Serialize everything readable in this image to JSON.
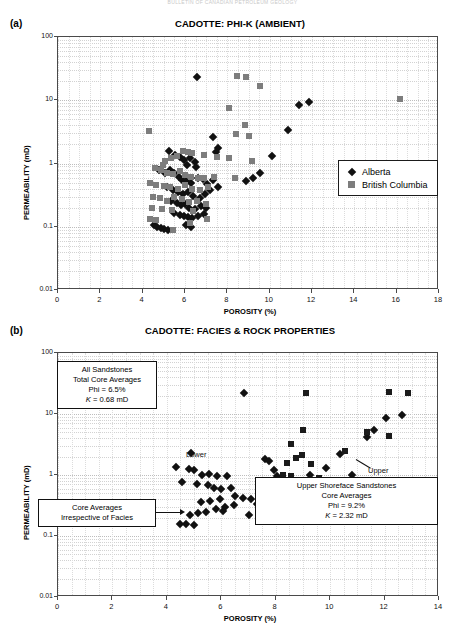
{
  "running_head": "BULLETIN OF CANADIAN PETROLEUM GEOLOGY",
  "panels": [
    {
      "letter": "(a)",
      "title": "CADOTTE: PHI-K (AMBIENT)",
      "legend": [
        {
          "label": "Alberta",
          "marker": "diamond",
          "color": "#111111"
        },
        {
          "label": "British Columbia",
          "marker": "square",
          "color": "#7d7d7d"
        }
      ]
    },
    {
      "letter": "(b)",
      "title": "CADOTTE: FACIES & ROCK PROPERTIES",
      "annotations": [
        {
          "name": "all-sandstones-box",
          "lines": [
            "All Sandstones",
            "Total Core Averages",
            "Phi = 6.5%",
            "K = 0.68 mD"
          ],
          "italic_symbol": "K"
        },
        {
          "name": "core-averages-box",
          "lines": [
            "Core  Averages",
            "Irrespective of Facies"
          ]
        },
        {
          "name": "upper-shoreface-box",
          "lines": [
            "Upper Shoreface Sandstones",
            "Core Averages",
            "Phi = 9.2%",
            "K = 2.32 mD"
          ],
          "italic_symbol": "K"
        }
      ],
      "point_labels": [
        {
          "name": "lower-label",
          "text": "Lower"
        },
        {
          "name": "upper-label",
          "text": "Upper"
        }
      ]
    }
  ],
  "chart_data": [
    {
      "type": "scatter",
      "title": "CADOTTE: PHI-K (AMBIENT)",
      "xlabel": "POROSITY (%)",
      "ylabel": "PERMEABILITY  (mD)",
      "xlim": [
        0,
        18
      ],
      "xticks": [
        0,
        2,
        4,
        6,
        8,
        10,
        12,
        14,
        16,
        18
      ],
      "ylim": [
        0.01,
        100
      ],
      "yscale": "log",
      "yticks": [
        0.01,
        0.1,
        1,
        10,
        100
      ],
      "ytick_labels": [
        "0.01",
        "0.1",
        "1",
        "10",
        "100"
      ],
      "grid": true,
      "legend_position": "lower-right",
      "series": [
        {
          "name": "Alberta",
          "marker": "diamond",
          "color": "#111111",
          "points": [
            [
              6.55,
              23.0
            ],
            [
              7.3,
              2.6
            ],
            [
              7.55,
              1.75
            ],
            [
              7.45,
              1.5
            ],
            [
              5.25,
              1.6
            ],
            [
              5.55,
              1.35
            ],
            [
              5.75,
              1.25
            ],
            [
              5.95,
              1.15
            ],
            [
              6.25,
              1.2
            ],
            [
              6.45,
              1.05
            ],
            [
              6.1,
              0.95
            ],
            [
              6.5,
              0.88
            ],
            [
              4.75,
              0.8
            ],
            [
              5.05,
              0.72
            ],
            [
              5.3,
              0.8
            ],
            [
              5.5,
              0.7
            ],
            [
              5.7,
              0.62
            ],
            [
              5.85,
              0.55
            ],
            [
              6.05,
              0.52
            ],
            [
              6.3,
              0.5
            ],
            [
              6.6,
              0.6
            ],
            [
              6.85,
              0.56
            ],
            [
              7.05,
              0.48
            ],
            [
              7.3,
              0.55
            ],
            [
              5.15,
              0.42
            ],
            [
              5.45,
              0.38
            ],
            [
              5.65,
              0.36
            ],
            [
              5.9,
              0.33
            ],
            [
              6.15,
              0.35
            ],
            [
              6.4,
              0.31
            ],
            [
              6.7,
              0.29
            ],
            [
              6.95,
              0.33
            ],
            [
              7.2,
              0.38
            ],
            [
              7.55,
              0.42
            ],
            [
              5.35,
              0.26
            ],
            [
              5.6,
              0.24
            ],
            [
              5.8,
              0.22
            ],
            [
              6.0,
              0.23
            ],
            [
              6.2,
              0.2
            ],
            [
              6.45,
              0.19
            ],
            [
              6.75,
              0.21
            ],
            [
              7.0,
              0.2
            ],
            [
              5.5,
              0.165
            ],
            [
              5.75,
              0.155
            ],
            [
              5.95,
              0.15
            ],
            [
              6.15,
              0.145
            ],
            [
              6.35,
              0.14
            ],
            [
              6.6,
              0.15
            ],
            [
              6.9,
              0.16
            ],
            [
              4.55,
              0.105
            ],
            [
              4.7,
              0.1
            ],
            [
              4.85,
              0.095
            ],
            [
              5.0,
              0.092
            ],
            [
              5.2,
              0.088
            ],
            [
              6.05,
              0.105
            ],
            [
              6.3,
              0.1
            ],
            [
              9.2,
              0.6
            ],
            [
              9.55,
              0.72
            ],
            [
              10.1,
              1.3
            ],
            [
              10.85,
              3.4
            ],
            [
              11.4,
              8.5
            ],
            [
              11.85,
              9.5
            ],
            [
              8.9,
              0.52
            ]
          ]
        },
        {
          "name": "British Columbia",
          "marker": "square",
          "color": "#7d7d7d",
          "points": [
            [
              8.45,
              24.0
            ],
            [
              8.9,
              23.0
            ],
            [
              9.55,
              16.5
            ],
            [
              16.15,
              10.5
            ],
            [
              8.1,
              7.5
            ],
            [
              8.85,
              4.0
            ],
            [
              8.4,
              2.9
            ],
            [
              9.0,
              2.7
            ],
            [
              4.3,
              3.3
            ],
            [
              5.9,
              1.55
            ],
            [
              6.15,
              1.5
            ],
            [
              6.35,
              1.45
            ],
            [
              5.6,
              1.3
            ],
            [
              5.35,
              1.2
            ],
            [
              5.05,
              1.1
            ],
            [
              4.95,
              0.95
            ],
            [
              6.9,
              1.35
            ],
            [
              7.5,
              1.25
            ],
            [
              8.1,
              1.2
            ],
            [
              9.15,
              1.1
            ],
            [
              4.6,
              0.85
            ],
            [
              4.85,
              0.78
            ],
            [
              5.15,
              0.72
            ],
            [
              5.45,
              0.68
            ],
            [
              5.75,
              0.75
            ],
            [
              6.0,
              0.66
            ],
            [
              6.3,
              0.62
            ],
            [
              6.6,
              0.6
            ],
            [
              6.9,
              0.58
            ],
            [
              7.35,
              0.62
            ],
            [
              8.35,
              0.6
            ],
            [
              4.35,
              0.5
            ],
            [
              4.65,
              0.46
            ],
            [
              5.0,
              0.44
            ],
            [
              5.3,
              0.42
            ],
            [
              5.65,
              0.4
            ],
            [
              6.0,
              0.45
            ],
            [
              6.35,
              0.4
            ],
            [
              6.7,
              0.38
            ],
            [
              7.1,
              0.42
            ],
            [
              4.5,
              0.3
            ],
            [
              4.8,
              0.28
            ],
            [
              5.15,
              0.26
            ],
            [
              5.5,
              0.3
            ],
            [
              5.85,
              0.27
            ],
            [
              6.2,
              0.25
            ],
            [
              6.55,
              0.26
            ],
            [
              7.0,
              0.23
            ],
            [
              4.45,
              0.2
            ],
            [
              4.9,
              0.19
            ],
            [
              5.4,
              0.185
            ],
            [
              6.4,
              0.175
            ],
            [
              4.35,
              0.135
            ],
            [
              4.65,
              0.13
            ],
            [
              6.25,
              0.115
            ],
            [
              7.05,
              0.135
            ],
            [
              5.45,
              0.09
            ]
          ]
        }
      ]
    },
    {
      "type": "scatter",
      "title": "CADOTTE: FACIES & ROCK PROPERTIES",
      "xlabel": "POROSITY (%)",
      "ylabel": "PERMEABILITY  (mD)",
      "xlim": [
        0,
        14
      ],
      "xticks": [
        0,
        2,
        4,
        6,
        8,
        10,
        12,
        14
      ],
      "ylim": [
        0.01,
        100
      ],
      "yscale": "log",
      "yticks": [
        0.01,
        0.1,
        1,
        10,
        100
      ],
      "ytick_labels": [
        "0.01",
        "0.1",
        "1",
        "10",
        "100"
      ],
      "grid": true,
      "series": [
        {
          "name": "Core averages (diamonds)",
          "marker": "diamond",
          "color": "#111111",
          "points": [
            [
              6.85,
              22.0
            ],
            [
              4.9,
              2.3
            ],
            [
              4.35,
              1.35
            ],
            [
              4.8,
              1.25
            ],
            [
              5.0,
              1.2
            ],
            [
              5.3,
              1.0
            ],
            [
              5.55,
              1.05
            ],
            [
              5.85,
              0.95
            ],
            [
              6.2,
              0.95
            ],
            [
              4.55,
              0.78
            ],
            [
              5.1,
              0.72
            ],
            [
              5.5,
              0.68
            ],
            [
              5.75,
              0.62
            ],
            [
              6.0,
              0.6
            ],
            [
              6.35,
              0.62
            ],
            [
              7.6,
              1.8
            ],
            [
              7.75,
              1.7
            ],
            [
              7.95,
              1.2
            ],
            [
              8.05,
              0.95
            ],
            [
              8.25,
              0.9
            ],
            [
              7.5,
              0.72
            ],
            [
              7.85,
              0.68
            ],
            [
              6.5,
              0.45
            ],
            [
              6.8,
              0.42
            ],
            [
              7.1,
              0.4
            ],
            [
              5.95,
              0.4
            ],
            [
              5.6,
              0.38
            ],
            [
              5.25,
              0.36
            ],
            [
              6.15,
              0.3
            ],
            [
              6.45,
              0.32
            ],
            [
              5.8,
              0.28
            ],
            [
              6.05,
              0.26
            ],
            [
              5.45,
              0.25
            ],
            [
              5.15,
              0.24
            ],
            [
              4.85,
              0.22
            ],
            [
              4.5,
              0.16
            ],
            [
              4.7,
              0.155
            ],
            [
              5.0,
              0.15
            ],
            [
              7.3,
              0.33
            ],
            [
              7.0,
              0.22
            ],
            [
              9.25,
              1.0
            ],
            [
              10.35,
              2.2
            ],
            [
              11.35,
              4.2
            ],
            [
              12.05,
              8.5
            ],
            [
              12.65,
              9.5
            ],
            [
              11.6,
              5.5
            ],
            [
              9.85,
              1.3
            ],
            [
              10.8,
              1.0
            ]
          ]
        },
        {
          "name": "Upper shoreface (squares)",
          "marker": "square",
          "color": "#1b1b1b",
          "points": [
            [
              9.1,
              22.0
            ],
            [
              12.15,
              23.0
            ],
            [
              12.85,
              22.0
            ],
            [
              9.0,
              5.5
            ],
            [
              8.55,
              3.2
            ],
            [
              11.35,
              5.0
            ],
            [
              12.15,
              4.3
            ],
            [
              10.55,
              2.5
            ],
            [
              8.95,
              2.1
            ],
            [
              8.75,
              1.9
            ],
            [
              8.4,
              1.55
            ],
            [
              9.3,
              1.5
            ],
            [
              8.25,
              1.0
            ],
            [
              8.55,
              0.95
            ],
            [
              8.15,
              0.8
            ],
            [
              8.6,
              0.78
            ],
            [
              9.6,
              0.9
            ],
            [
              10.15,
              0.78
            ],
            [
              8.85,
              0.7
            ],
            [
              8.35,
              0.62
            ],
            [
              7.95,
              0.5
            ],
            [
              8.15,
              0.48
            ],
            [
              11.0,
              0.38
            ],
            [
              12.1,
              0.42
            ],
            [
              12.15,
              0.3
            ],
            [
              10.3,
              0.55
            ]
          ]
        }
      ]
    }
  ]
}
